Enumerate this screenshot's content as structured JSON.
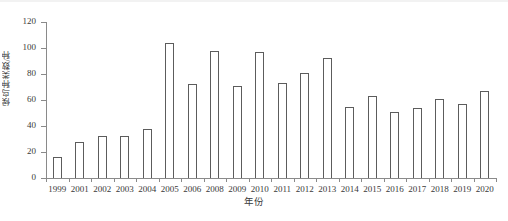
{
  "chart_data": {
    "type": "bar",
    "title": "",
    "xlabel": "年份",
    "ylabel": "候鸟种类数/种",
    "categories": [
      "1999",
      "2001",
      "2002",
      "2003",
      "2004",
      "2005",
      "2006",
      "2008",
      "2009",
      "2010",
      "2011",
      "2012",
      "2013",
      "2014",
      "2015",
      "2016",
      "2017",
      "2018",
      "2019",
      "2020"
    ],
    "values": [
      16,
      28,
      32,
      32,
      38,
      104,
      72,
      98,
      71,
      97,
      73,
      81,
      92,
      55,
      63,
      51,
      54,
      61,
      57,
      67
    ],
    "ylim": [
      0,
      120
    ],
    "ytick_step": 20,
    "yticks": [
      0,
      20,
      40,
      60,
      80,
      100,
      120
    ],
    "grid": false,
    "legend": null,
    "series": [
      {
        "name": "候鸟种类数",
        "values": [
          16,
          28,
          32,
          32,
          38,
          104,
          72,
          98,
          71,
          97,
          73,
          81,
          92,
          55,
          63,
          51,
          54,
          61,
          57,
          67
        ]
      }
    ],
    "bar_fill_color": "#ffffff",
    "bar_edge_color": "#5c5c5c",
    "axis_color": "#8a8a8a",
    "text_color": "#3a3a3a"
  }
}
